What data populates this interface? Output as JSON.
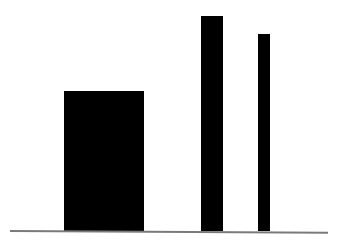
{
  "chart_data": {
    "type": "bar",
    "title": "",
    "xlabel": "",
    "ylabel": "",
    "categories": [
      "",
      "",
      ""
    ],
    "values": [
      140,
      215,
      197
    ],
    "grid": false,
    "legend": null,
    "bar_color": "#000000",
    "baseline_color": "#7a7a7a",
    "bars": [
      {
        "left": 64,
        "width": 80,
        "height": 140
      },
      {
        "left": 201,
        "width": 22,
        "height": 215
      },
      {
        "left": 258,
        "width": 12,
        "height": 197
      }
    ]
  }
}
